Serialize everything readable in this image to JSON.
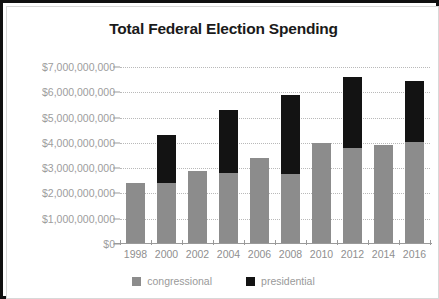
{
  "chart_data": {
    "type": "bar",
    "title": "Total Federal Election Spending",
    "xlabel": "",
    "ylabel": "",
    "stacked": true,
    "grid": true,
    "legend_position": "bottom",
    "ylim": [
      0,
      7000000000
    ],
    "yticks": [
      0,
      1000000000,
      2000000000,
      3000000000,
      4000000000,
      5000000000,
      6000000000,
      7000000000
    ],
    "ytick_labels": [
      "$0",
      "$1,000,000,000",
      "$2,000,000,000",
      "$3,000,000,000",
      "$4,000,000,000",
      "$5,000,000,000",
      "$6,000,000,000",
      "$7,000,000,000"
    ],
    "categories": [
      "1998",
      "2000",
      "2002",
      "2004",
      "2006",
      "2008",
      "2010",
      "2012",
      "2014",
      "2016"
    ],
    "series": [
      {
        "name": "congressional",
        "color": "#8c8c8c",
        "values": [
          2400000000,
          2400000000,
          2900000000,
          2800000000,
          3400000000,
          2750000000,
          4000000000,
          3800000000,
          3900000000,
          4050000000
        ]
      },
      {
        "name": "presidential",
        "color": "#131313",
        "values": [
          0,
          1900000000,
          0,
          2500000000,
          0,
          3150000000,
          0,
          2800000000,
          0,
          2400000000
        ]
      }
    ],
    "totals": [
      2400000000,
      4300000000,
      2900000000,
      5300000000,
      3400000000,
      5900000000,
      4000000000,
      6600000000,
      3900000000,
      6450000000
    ]
  },
  "legend": {
    "items": [
      {
        "label": "congressional",
        "color": "#8c8c8c"
      },
      {
        "label": "presidential",
        "color": "#131313"
      }
    ]
  }
}
